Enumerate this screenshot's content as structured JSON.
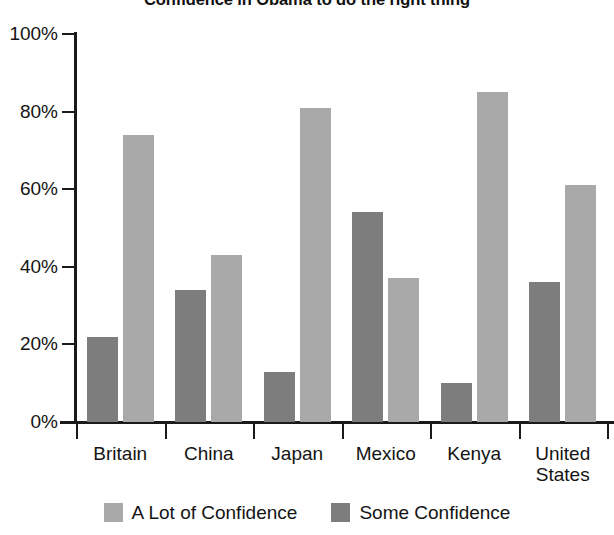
{
  "chart_data": {
    "type": "bar",
    "title": "Confidence in Obama to do the right thing",
    "xlabel": "",
    "ylabel": "",
    "ylim": [
      0,
      100
    ],
    "y_ticks": [
      "0%",
      "20%",
      "40%",
      "60%",
      "80%",
      "100%"
    ],
    "y_tick_values": [
      0,
      20,
      40,
      60,
      80,
      100
    ],
    "grid": false,
    "legend_position": "bottom",
    "categories": [
      "Britain",
      "China",
      "Japan",
      "Mexico",
      "Kenya",
      "United States"
    ],
    "series": [
      {
        "name": "Some Confidence",
        "color": "#7d7d7d",
        "values": [
          22,
          34,
          13,
          54,
          10,
          36
        ]
      },
      {
        "name": "A Lot of Confidence",
        "color": "#a9a9a9",
        "values": [
          74,
          43,
          81,
          37,
          85,
          61
        ]
      }
    ],
    "series_order_in_group": [
      "Some Confidence",
      "A Lot of Confidence"
    ]
  },
  "legend": {
    "items": [
      {
        "label": "A Lot of Confidence",
        "swatch": "alot"
      },
      {
        "label": "Some Confidence",
        "swatch": "some"
      }
    ]
  },
  "axis": {
    "category_labels": [
      {
        "line1": "Britain",
        "line2": ""
      },
      {
        "line1": "China",
        "line2": ""
      },
      {
        "line1": "Japan",
        "line2": ""
      },
      {
        "line1": "Mexico",
        "line2": ""
      },
      {
        "line1": "Kenya",
        "line2": ""
      },
      {
        "line1": "United",
        "line2": "States"
      }
    ]
  }
}
